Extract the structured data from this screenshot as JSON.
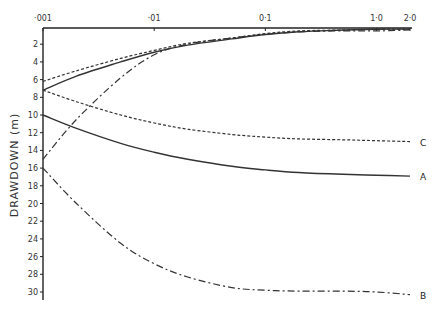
{
  "chart_data": {
    "type": "line",
    "title": "",
    "xlabel": "",
    "ylabel": "DRAWDOWN (m)",
    "xscale": "log",
    "x_axis_position": "top",
    "y_inverted": true,
    "xlim": [
      0.001,
      2.0
    ],
    "ylim": [
      0,
      31
    ],
    "grid": false,
    "x_ticks": [
      {
        "value": 0.001,
        "label": "·001"
      },
      {
        "value": 0.01,
        "label": "·01"
      },
      {
        "value": 0.1,
        "label": "0·1"
      },
      {
        "value": 1.0,
        "label": "1·0"
      },
      {
        "value": 2.0,
        "label": "2·0"
      }
    ],
    "y_ticks": [
      2,
      4,
      6,
      8,
      10,
      12,
      14,
      16,
      18,
      20,
      22,
      24,
      26,
      28,
      30
    ],
    "x": [
      0.001,
      0.002,
      0.005,
      0.01,
      0.02,
      0.05,
      0.1,
      0.2,
      0.5,
      1.0,
      2.0
    ],
    "series": [
      {
        "name": "A",
        "label": "A",
        "style": "solid",
        "values": [
          10.0,
          11.5,
          13.2,
          14.2,
          15.0,
          15.8,
          16.2,
          16.5,
          16.7,
          16.8,
          16.9
        ]
      },
      {
        "name": "B",
        "label": "B",
        "style": "dash-dot",
        "values": [
          16.0,
          20.0,
          24.5,
          26.8,
          28.3,
          29.5,
          29.8,
          29.9,
          29.9,
          30.0,
          30.3
        ]
      },
      {
        "name": "C",
        "label": "C",
        "style": "dotted",
        "values": [
          7.2,
          8.5,
          10.0,
          10.9,
          11.6,
          12.2,
          12.5,
          12.7,
          12.8,
          12.9,
          13.0
        ]
      },
      {
        "name": "A-upper",
        "label": "",
        "style": "solid",
        "values": [
          7.2,
          5.6,
          4.0,
          2.9,
          2.1,
          1.4,
          0.9,
          0.6,
          0.4,
          0.3,
          0.3
        ]
      },
      {
        "name": "C-upper",
        "label": "",
        "style": "dotted",
        "values": [
          6.2,
          5.0,
          3.6,
          2.7,
          1.9,
          1.3,
          0.8,
          0.5,
          0.4,
          0.3,
          0.3
        ]
      },
      {
        "name": "B-upper",
        "label": "",
        "style": "dash-dot",
        "values": [
          15.0,
          10.5,
          5.8,
          3.2,
          2.0,
          1.3,
          0.9,
          0.6,
          0.5,
          0.5,
          0.4
        ]
      }
    ]
  }
}
